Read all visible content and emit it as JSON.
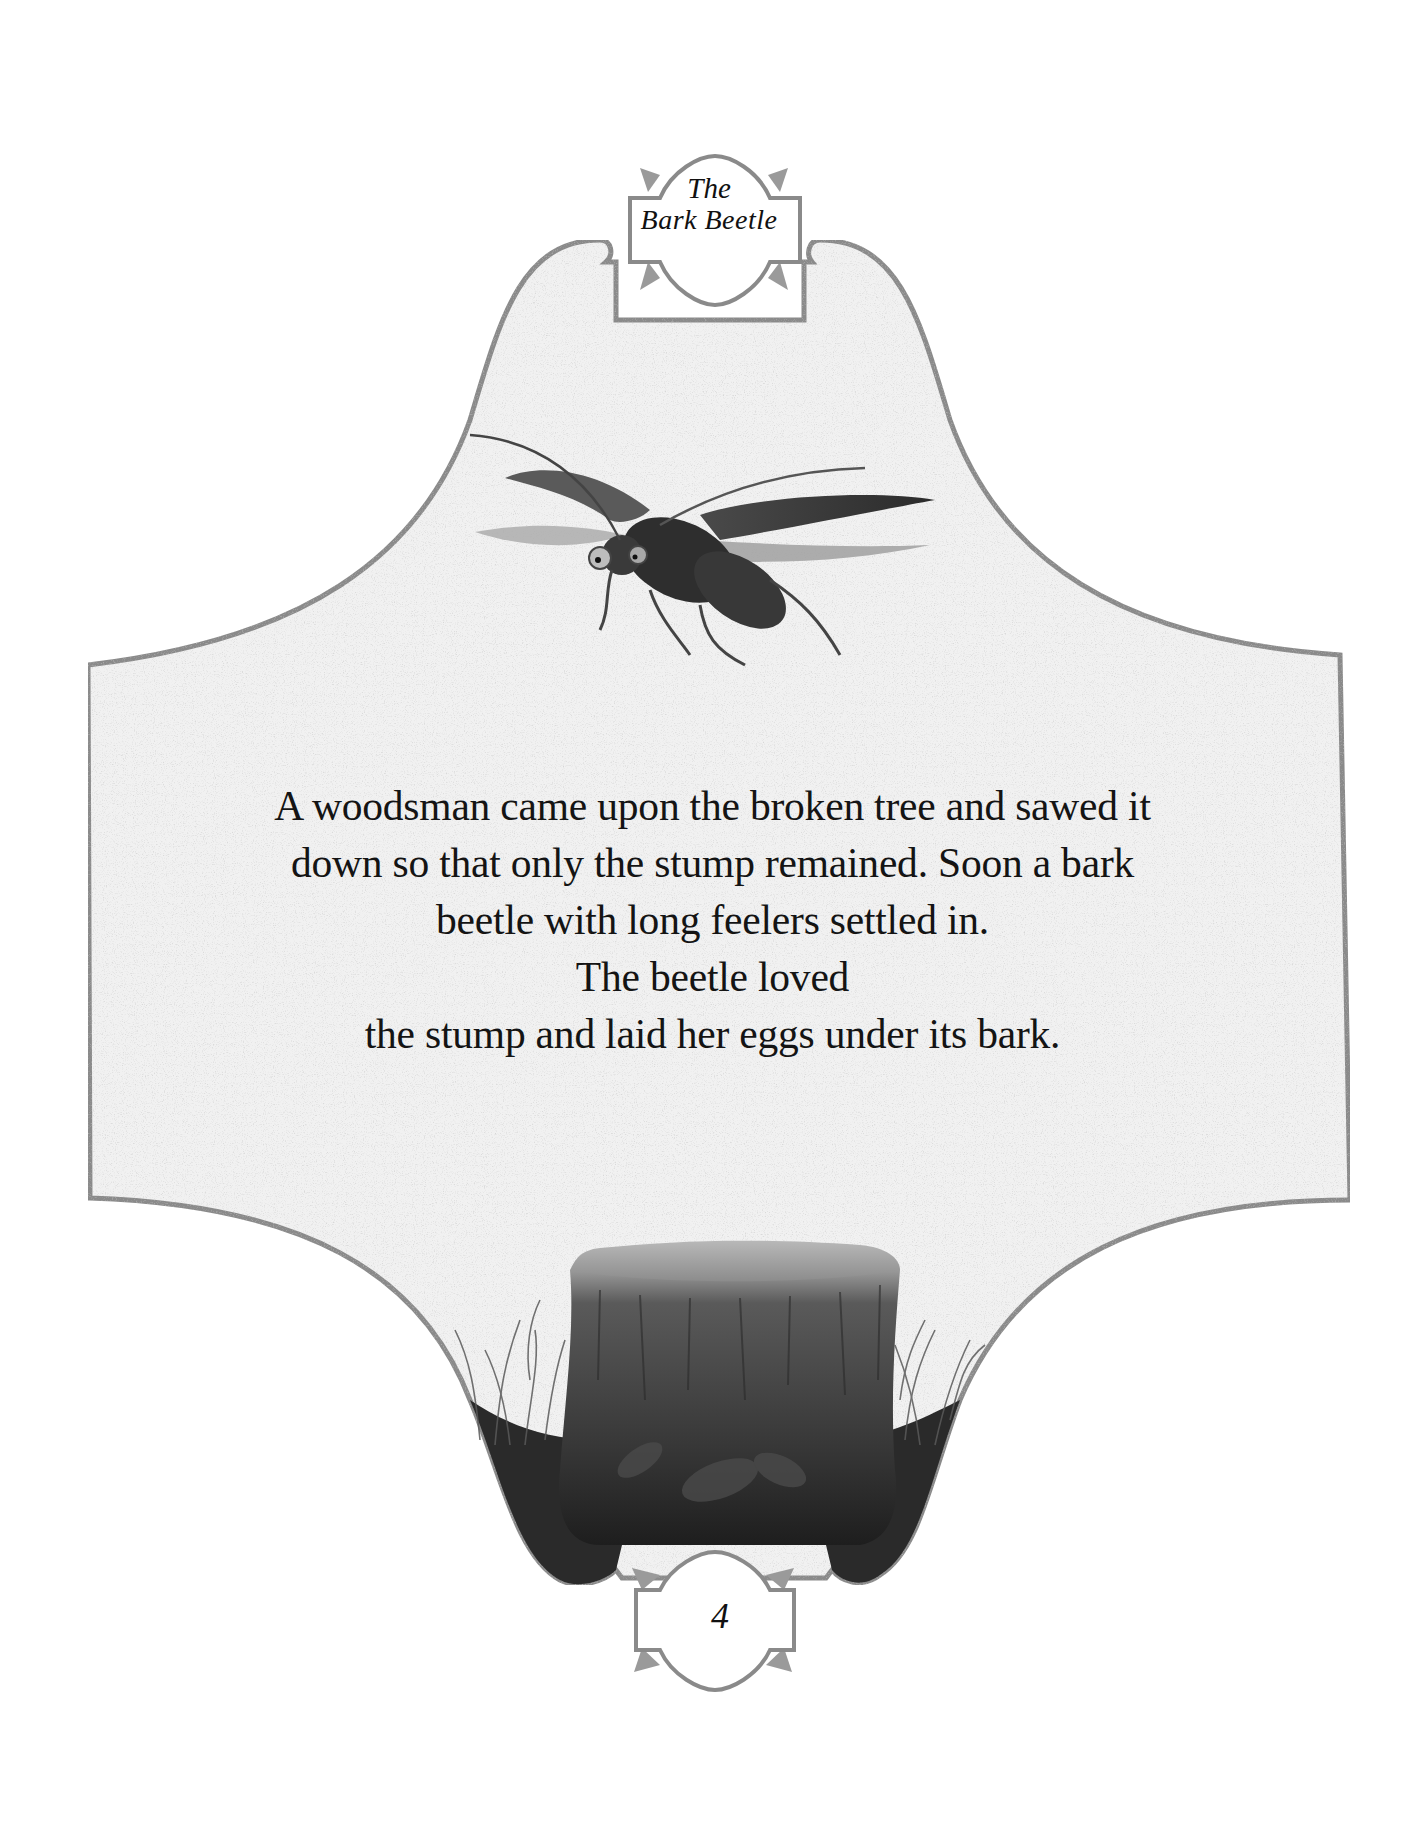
{
  "page": {
    "title": {
      "line1": "The",
      "line2": "Bark Beetle"
    },
    "illustrations": {
      "top": "flying-bark-beetle",
      "bottom": "tree-stump-with-grass"
    },
    "body": {
      "lines": [
        "A woodsman came upon the broken tree and sawed it",
        "down so that only the stump remained. Soon a bark",
        "beetle with long feelers settled in.",
        "The beetle loved",
        "the stump and laid her eggs under its bark."
      ]
    },
    "page_number": "4",
    "colors": {
      "frame_stroke": "#8a8a8a",
      "paper_fill": "#f1f1f1",
      "ink": "#141414",
      "background": "#ffffff"
    }
  }
}
